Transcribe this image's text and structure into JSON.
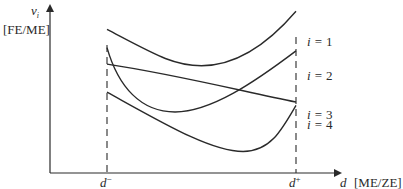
{
  "chart_data": {
    "type": "line",
    "title": "",
    "ylabel": "v_i",
    "ylabel_unit": "[FE/ME]",
    "xlabel": "d",
    "xlabel_unit": "[ME/ZE]",
    "x_markers": [
      {
        "name": "d_minus",
        "label": "d",
        "sup": "−"
      },
      {
        "name": "d_plus",
        "label": "d",
        "sup": "+"
      }
    ],
    "series": [
      {
        "name": "i = 1",
        "var": "i",
        "eq": "=",
        "index": "1"
      },
      {
        "name": "i = 2",
        "var": "i",
        "eq": "=",
        "index": "2"
      },
      {
        "name": "i = 3",
        "var": "i",
        "eq": "=",
        "index": "3"
      },
      {
        "name": "i = 4",
        "var": "i",
        "eq": "=",
        "index": "4"
      }
    ],
    "curve_shapes": {
      "i=1": {
        "start": 0.87,
        "min": 0.65,
        "end": 0.98,
        "shape": "U-shaped, minimum left of center"
      },
      "i=2": {
        "start": 0.76,
        "min": 0.37,
        "end": 0.74,
        "shape": "steep drop then rise"
      },
      "i=3": {
        "start": 0.66,
        "end": 0.43,
        "shape": "nearly linear decreasing"
      },
      "i=4": {
        "start": 0.49,
        "min": 0.13,
        "end": 0.41,
        "shape": "decline to late minimum then sharp rise"
      }
    },
    "note": "Values are relative (0–1) along the y-axis range between the x-axis and the top of the y-axis; the diagram has no numeric ticks."
  }
}
